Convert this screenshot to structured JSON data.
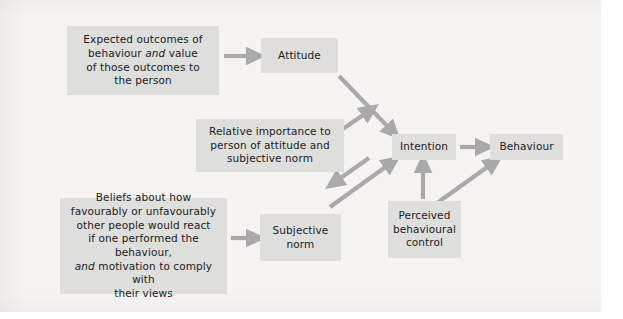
{
  "diagram": {
    "background_color": "#f4f3f1",
    "node_color": "#dededd",
    "arrow_color": "#a9a9a9",
    "text_color": "#1c1c1c",
    "nodes": {
      "beliefs_outcomes": {
        "lines": [
          "Expected outcomes of",
          "behaviour and value",
          "of those outcomes to",
          "the person"
        ],
        "italic_word": "and"
      },
      "attitude": {
        "label": "Attitude"
      },
      "relative_importance": {
        "lines": [
          "Relative importance to",
          "person of attitude and",
          "subjective norm"
        ]
      },
      "normative_beliefs": {
        "lines": [
          "Beliefs about how",
          "favourably or unfavourably",
          "other people would react",
          "if one performed the behaviour,",
          "and motivation to comply with",
          "their views"
        ],
        "italic_word": "and"
      },
      "subjective_norm": {
        "lines": [
          "Subjective",
          "norm"
        ]
      },
      "intention": {
        "label": "Intention"
      },
      "behaviour": {
        "label": "Behaviour"
      },
      "perceived_behavioural_control": {
        "lines": [
          "Perceived",
          "behavioural",
          "control"
        ]
      }
    },
    "arrows": [
      {
        "from": "beliefs_outcomes",
        "to": "attitude",
        "style": "horizontal-right"
      },
      {
        "from": "attitude",
        "to": "intention",
        "style": "diagonal-down-right"
      },
      {
        "from": "relative_importance",
        "to": "intention",
        "style": "diagonal-up-right"
      },
      {
        "from": "relative_importance",
        "to": "subjective_norm_region",
        "style": "diagonal-down-left"
      },
      {
        "from": "normative_beliefs",
        "to": "subjective_norm",
        "style": "horizontal-right"
      },
      {
        "from": "subjective_norm",
        "to": "intention",
        "style": "diagonal-up-right"
      },
      {
        "from": "perceived_behavioural_control",
        "to": "intention",
        "style": "vertical-up"
      },
      {
        "from": "perceived_behavioural_control",
        "to": "behaviour",
        "style": "diagonal-up-right"
      },
      {
        "from": "intention",
        "to": "behaviour",
        "style": "horizontal-right"
      }
    ]
  }
}
